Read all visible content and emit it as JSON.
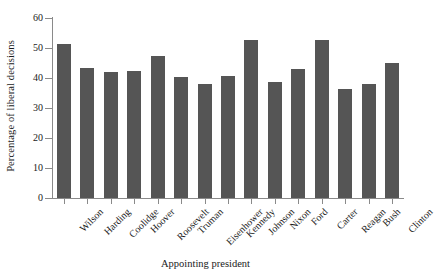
{
  "chart_data": {
    "type": "bar",
    "title": "",
    "xlabel": "Appointing president",
    "ylabel": "Percentage of liberal decisions",
    "ylim": [
      0,
      60
    ],
    "yticks": [
      0,
      10,
      20,
      30,
      40,
      50,
      60
    ],
    "grid": false,
    "legend": null,
    "bar_color": "#555555",
    "axis_color": "#8a8a8a",
    "categories": [
      "Wilson",
      "Harding",
      "Coolidge",
      "Hoover",
      "Roosevelt",
      "Truman",
      "Eisenhower",
      "Kennedy",
      "Johnson",
      "Nixon",
      "Ford",
      "Carter",
      "Reagan",
      "Bush",
      "Clinton"
    ],
    "values": [
      51.4,
      43.3,
      42.0,
      42.5,
      47.2,
      40.4,
      37.9,
      40.8,
      52.7,
      38.7,
      42.9,
      52.7,
      36.5,
      38.1,
      45.0
    ]
  }
}
